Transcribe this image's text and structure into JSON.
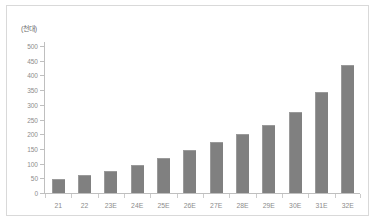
{
  "chart_data": {
    "type": "bar",
    "title": "",
    "unit_label": "(천대)",
    "xlabel": "",
    "ylabel": "",
    "ylim": [
      0,
      500
    ],
    "ytick_step": 50,
    "yticks": [
      0,
      50,
      100,
      150,
      200,
      250,
      300,
      350,
      400,
      450,
      500
    ],
    "ytick_labels": [
      "0",
      "50",
      "100",
      "150",
      "200",
      "250",
      "300",
      "350",
      "400",
      "450",
      "500"
    ],
    "grid": false,
    "legend": "none",
    "bar_color": "#808080",
    "categories": [
      "21",
      "22",
      "23E",
      "24E",
      "25E",
      "26E",
      "27E",
      "28E",
      "29E",
      "30E",
      "31E",
      "32E"
    ],
    "values": [
      48,
      60,
      75,
      95,
      120,
      145,
      172,
      200,
      233,
      276,
      345,
      435
    ]
  }
}
